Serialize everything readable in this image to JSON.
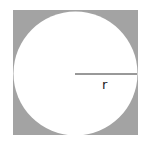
{
  "diagram": {
    "square": {
      "x": 13,
      "y": 10,
      "size": 125,
      "fill": "#a3a3a3"
    },
    "circle": {
      "cx": 75.5,
      "cy": 73.5,
      "r": 62,
      "fill": "#ffffff"
    },
    "radius_line": {
      "x1": 75,
      "y1": 74,
      "x2": 137,
      "y2": 74,
      "stroke": "#333333"
    },
    "label": {
      "text": "r",
      "x": 102,
      "y": 89
    }
  }
}
